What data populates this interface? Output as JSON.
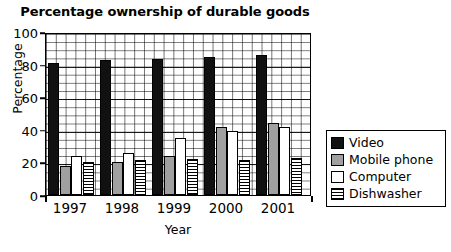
{
  "chart_data": {
    "type": "bar",
    "title": "Percentage ownership of durable goods",
    "xlabel": "Year",
    "ylabel": "Percentage",
    "categories": [
      "1997",
      "1998",
      "1999",
      "2000",
      "2001"
    ],
    "ylim": [
      0,
      100
    ],
    "yticks": [
      0,
      20,
      40,
      60,
      80,
      100
    ],
    "ytick_labels": [
      "0",
      "20",
      "40",
      "60",
      "80",
      "100"
    ],
    "grid": true,
    "grid_minor_step": 5,
    "legend_position": "right",
    "series": [
      {
        "name": "Video",
        "fill": "#111111",
        "pattern": "solid-black",
        "values": [
          81,
          83,
          83.5,
          84.5,
          86
        ]
      },
      {
        "name": "Mobile phone",
        "fill": "#a0a0a0",
        "pattern": "solid-gray",
        "values": [
          17.5,
          20,
          24,
          42,
          44
        ]
      },
      {
        "name": "Computer",
        "fill": "#ffffff",
        "pattern": "solid-white",
        "values": [
          24,
          26,
          35,
          39,
          42
        ]
      },
      {
        "name": "Dishwasher",
        "fill": "#ffffff",
        "pattern": "horizontal-lines",
        "values": [
          20,
          21.5,
          22,
          21.5,
          23
        ]
      }
    ]
  }
}
